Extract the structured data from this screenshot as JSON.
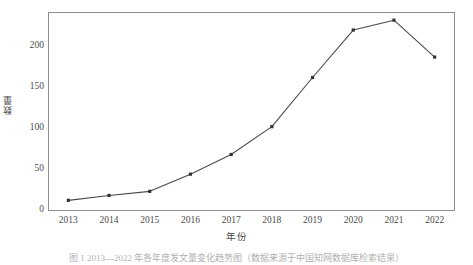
{
  "chart_data": {
    "type": "line",
    "title": "",
    "subtitle": "",
    "xlabel": "年份",
    "ylabel": "数量",
    "categories": [
      "2013",
      "2014",
      "2015",
      "2016",
      "2017",
      "2018",
      "2019",
      "2020",
      "2021",
      "2022"
    ],
    "x": [
      2013,
      2014,
      2015,
      2016,
      2017,
      2018,
      2019,
      2020,
      2021,
      2022
    ],
    "values": [
      5,
      11,
      16,
      37,
      61,
      95,
      155,
      213,
      225,
      180
    ],
    "series": [
      {
        "name": "数量",
        "values": [
          5,
          11,
          16,
          37,
          61,
          95,
          155,
          213,
          225,
          180
        ]
      }
    ],
    "xlim": [
      2012.5,
      2022.5
    ],
    "ylim": [
      -8,
      235
    ],
    "yticks": [
      0,
      50,
      100,
      150,
      200
    ],
    "ytick_labels": [
      "0",
      "50",
      "100",
      "150",
      "200"
    ],
    "xtick_labels": [
      "2013",
      "2014",
      "2015",
      "2016",
      "2017",
      "2018",
      "2019",
      "2020",
      "2021",
      "2022"
    ],
    "grid": false,
    "legend": false,
    "legend_position": "none",
    "marker": "square",
    "line_color": "#4a4a4a",
    "marker_color": "#333333",
    "frame_color": "#8d8d8d",
    "background_color": "#ffffff"
  },
  "caption": "图 1  2013—2022 年各年度发文量变化趋势图（数据来源于中国知网数据库检索结果）"
}
